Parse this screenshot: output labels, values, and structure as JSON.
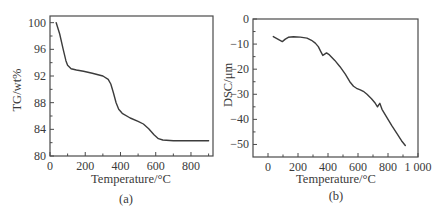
{
  "chart_data": [
    {
      "type": "line",
      "panel_label": "(a)",
      "title": "",
      "xlabel": "Temperature/°C",
      "ylabel": "TG/wt%",
      "xlim": [
        0,
        925
      ],
      "ylim": [
        80,
        101
      ],
      "xticks": [
        0,
        200,
        400,
        600,
        800
      ],
      "xticks_minor": [
        100,
        300,
        500,
        700,
        900
      ],
      "yticks": [
        80,
        84,
        88,
        92,
        96,
        100
      ],
      "yticks_minor": [
        82,
        86,
        90,
        94,
        98
      ],
      "grid": false,
      "legend": null,
      "series": [
        {
          "name": "TG",
          "x": [
            35,
            55,
            75,
            90,
            100,
            120,
            150,
            190,
            240,
            300,
            330,
            345,
            360,
            375,
            390,
            410,
            455,
            500,
            530,
            560,
            590,
            615,
            640,
            700,
            800,
            900
          ],
          "y": [
            100,
            98.3,
            96,
            94.3,
            93.6,
            93.1,
            92.9,
            92.7,
            92.4,
            92.0,
            91.5,
            90.8,
            89.5,
            88.0,
            87.0,
            86.4,
            85.7,
            85.2,
            84.8,
            84.1,
            83.2,
            82.6,
            82.4,
            82.3,
            82.3,
            82.3
          ]
        }
      ]
    },
    {
      "type": "line",
      "panel_label": "(b)",
      "title": "",
      "xlabel": "Temperature/°C",
      "ylabel": "DSC/μm",
      "xlim": [
        -100,
        1000
      ],
      "ylim": [
        -55,
        0
      ],
      "xticks": [
        0,
        200,
        400,
        600,
        800,
        1000
      ],
      "xtick_labels": [
        "0",
        "200",
        "400",
        "600",
        "800",
        "1 000"
      ],
      "xticks_minor": [
        100,
        300,
        500,
        700,
        900
      ],
      "yticks": [
        0,
        -10,
        -20,
        -30,
        -40,
        -50
      ],
      "yticks_minor": [
        -5,
        -15,
        -25,
        -35,
        -45
      ],
      "grid": false,
      "legend": null,
      "series": [
        {
          "name": "DSC",
          "x": [
            35,
            65,
            95,
            115,
            135,
            170,
            215,
            260,
            290,
            315,
            335,
            352,
            365,
            378,
            390,
            410,
            445,
            480,
            515,
            545,
            570,
            590,
            615,
            635,
            660,
            690,
            715,
            730,
            738,
            745,
            760,
            790,
            825,
            860,
            890,
            915
          ],
          "y": [
            -7,
            -8,
            -9,
            -8,
            -7.3,
            -7.1,
            -7.2,
            -7.6,
            -8.5,
            -9.6,
            -11,
            -13,
            -14.5,
            -14,
            -13.5,
            -14.3,
            -16.5,
            -19,
            -22,
            -25,
            -26.8,
            -27.6,
            -28.2,
            -28.8,
            -30,
            -31.8,
            -33.6,
            -35,
            -34.2,
            -33.6,
            -36,
            -39,
            -42.5,
            -45.7,
            -48.5,
            -50.4
          ]
        }
      ]
    }
  ],
  "panels": {
    "a": {
      "xlabel": "Temperature/°C",
      "ylabel": "TG/wt%",
      "caption": "(a)",
      "xtick_labels": [
        "0",
        "200",
        "400",
        "600",
        "800"
      ],
      "ytick_labels": [
        "80",
        "84",
        "88",
        "92",
        "96",
        "100"
      ]
    },
    "b": {
      "xlabel": "Temperature/°C",
      "ylabel": "DSC/μm",
      "caption": "(b)",
      "xtick_labels": [
        "0",
        "200",
        "400",
        "600",
        "800",
        "1 000"
      ],
      "ytick_labels": [
        "0",
        "−10",
        "−20",
        "−30",
        "−40",
        "−50"
      ]
    }
  },
  "colors": {
    "line": "#3c3c3c",
    "axes": "#4a4a4a",
    "text": "#3a3a3a",
    "background": "#ffffff"
  }
}
